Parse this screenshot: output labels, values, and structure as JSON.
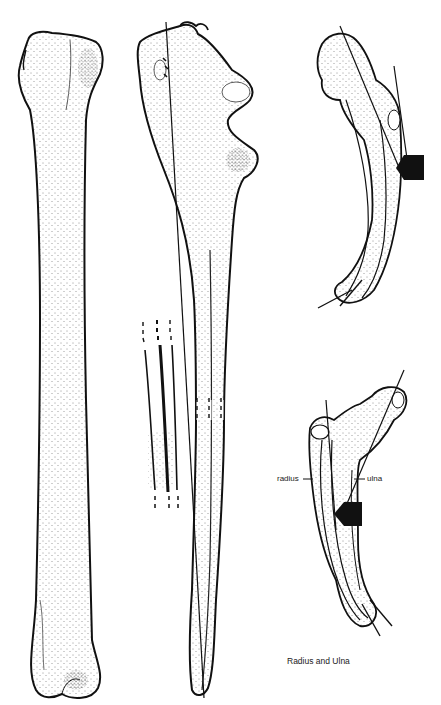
{
  "figure": {
    "caption": "Radius and Ulna",
    "labels": {
      "radius": "radius",
      "ulna": "ulna"
    },
    "panels": [
      {
        "id": "radius-long",
        "description": "Radius, full length view with stippling"
      },
      {
        "id": "ulna-long",
        "description": "Ulna, full length view with axis line and dashed break"
      },
      {
        "id": "cross-section-detail",
        "description": "Dashed-line detail of shaft curvature"
      },
      {
        "id": "radius-ulna-upper",
        "description": "Articulated radius and ulna with axis lines and force arrow"
      },
      {
        "id": "radius-ulna-lower",
        "description": "Articulated radius and ulna with labels and force arrow"
      }
    ],
    "colors": {
      "ink": "#111111",
      "paper": "#ffffff"
    }
  }
}
